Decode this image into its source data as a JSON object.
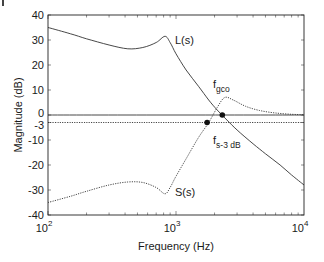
{
  "chart_data": {
    "type": "line",
    "title": "",
    "xlabel": "Frequency (Hz)",
    "ylabel": "Magnitude (dB)",
    "xscale": "log",
    "xlim": [
      100,
      10000
    ],
    "ylim": [
      -40,
      40
    ],
    "grid": false,
    "legend": "none (inline curve labels)",
    "x_ticks": [
      {
        "value": 100,
        "base": "10",
        "exp": "2"
      },
      {
        "value": 1000,
        "base": "10",
        "exp": "3"
      },
      {
        "value": 10000,
        "base": "10",
        "exp": "4"
      }
    ],
    "y_ticks": [
      {
        "value": 40,
        "label": "40"
      },
      {
        "value": 30,
        "label": "30"
      },
      {
        "value": 20,
        "label": "20"
      },
      {
        "value": 10,
        "label": "10"
      },
      {
        "value": 0,
        "label": "0"
      },
      {
        "value": -3,
        "label": "-3"
      },
      {
        "value": -10,
        "label": "-10"
      },
      {
        "value": -20,
        "label": "-20"
      },
      {
        "value": -30,
        "label": "-30"
      },
      {
        "value": -40,
        "label": "-40"
      }
    ],
    "series": [
      {
        "name": "L(s)",
        "style": "solid",
        "x": [
          100,
          150,
          200,
          300,
          420,
          550,
          700,
          820,
          900,
          1000,
          1200,
          1500,
          1800,
          2100,
          2500,
          3000,
          4000,
          5000,
          6500,
          8000,
          10000
        ],
        "y": [
          35,
          32.5,
          30.5,
          28,
          26.5,
          27,
          29,
          31.5,
          29,
          24.5,
          18,
          11.5,
          6,
          2,
          -2,
          -6,
          -11.5,
          -15.5,
          -20,
          -24,
          -28
        ]
      },
      {
        "name": "S(s)",
        "style": "dotted",
        "x": [
          100,
          150,
          200,
          300,
          420,
          550,
          700,
          820,
          900,
          1000,
          1200,
          1500,
          1800,
          2100,
          2400,
          2800,
          3500,
          4500,
          6000,
          8000,
          10000
        ],
        "y": [
          -35,
          -32.5,
          -30.5,
          -28,
          -26.8,
          -27,
          -29,
          -31.5,
          -29,
          -24.5,
          -17.5,
          -9,
          -3,
          3,
          7,
          6,
          3.5,
          1.8,
          0.8,
          0.3,
          0.1
        ]
      },
      {
        "name": "0 dB reference",
        "style": "solid",
        "x": [
          100,
          10000
        ],
        "y": [
          0,
          0
        ]
      },
      {
        "name": "-3 dB reference",
        "style": "dotted",
        "x": [
          100,
          10000
        ],
        "y": [
          -3,
          -3
        ]
      }
    ],
    "markers": [
      {
        "name": "f_gco",
        "x": 2300,
        "y": 0
      },
      {
        "name": "f_s-3 dB",
        "x": 1750,
        "y": -3
      }
    ],
    "annotations": [
      {
        "text": "L(s)",
        "near": "L(s) peak ~820 Hz"
      },
      {
        "text": "S(s)",
        "near": "S(s) dip ~820 Hz"
      },
      {
        "text": "f",
        "subscript": "gco",
        "near": "crossover marker"
      },
      {
        "text": "f",
        "subscript": "s-3 dB",
        "near": "-3 dB marker"
      }
    ]
  },
  "labels": {
    "xlabel": "Frequency (Hz)",
    "ylabel": "Magnitude (dB)",
    "L_label": "L(s)",
    "S_label": "S(s)",
    "fgco_main": "f",
    "fgco_sub": "gco",
    "fs3_main": "f",
    "fs3_sub": "s-3 dB"
  }
}
